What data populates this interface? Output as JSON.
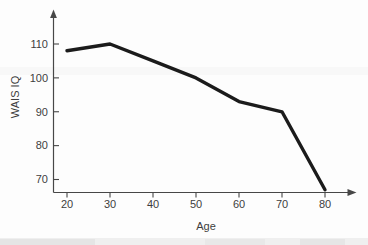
{
  "figure": {
    "background_color": "#fdfdfd",
    "line_color": "#1b1b1b",
    "axis_color": "#474747",
    "label_color": "#3d3d3d",
    "artifact_color": "#ececec"
  },
  "chart_data": {
    "type": "line",
    "x": [
      20,
      30,
      40,
      50,
      60,
      70,
      80
    ],
    "series": [
      {
        "name": "WAIS IQ",
        "values": [
          108,
          110,
          105,
          100,
          93,
          90,
          67
        ]
      }
    ],
    "title": "",
    "xlabel": "Age",
    "ylabel": "WAIS IQ",
    "x_ticks": [
      20,
      30,
      40,
      50,
      60,
      70,
      80
    ],
    "y_ticks": [
      110,
      100,
      90,
      80,
      70
    ],
    "xlim": [
      20,
      80
    ],
    "ylim": [
      65,
      115
    ],
    "grid": false,
    "legend": "none",
    "axes_arrows": true,
    "line_width_px": 3.4
  }
}
